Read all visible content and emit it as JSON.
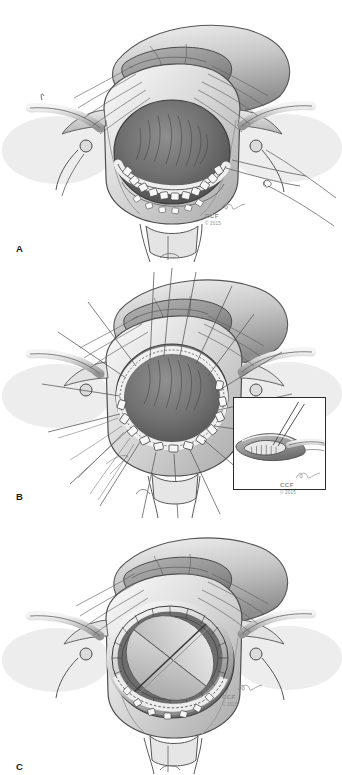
{
  "figure": {
    "background_color": "#ffffff",
    "ink_color": "#3a3a3a",
    "style": "grayscale pen-and-ink and wash surgical illustration",
    "panel_count": 3
  },
  "panels": [
    {
      "label": "A",
      "name": "panel-a",
      "caption": "Aortotomy opened with stay sutures; diseased aortic valve leaflets excised and interrupted pledgeted sutures placed through the aortic annulus",
      "structures": [
        "aortotomy incision",
        "aortic root",
        "right atrial appendage",
        "pulmonary artery",
        "aortic annulus",
        "pledgeted annular sutures",
        "retraction stay sutures",
        "coronary ostium"
      ],
      "signature": {
        "mark": "CCF",
        "year": "© 2015"
      }
    },
    {
      "label": "B",
      "name": "panel-b",
      "caption": "Full circumference of interrupted pledgeted mattress sutures placed around the annulus and splayed radially on the field",
      "structures": [
        "aortic annulus",
        "circumferential pledgeted mattress sutures",
        "radiating suture tails",
        "aortotomy edges",
        "stay sutures"
      ],
      "inset": {
        "name": "suture-technique-inset",
        "caption": "Detail: pledgeted mattress suture passed from ventricular side through the annulus",
        "signature": {
          "mark": "CCF",
          "year": "© 2015"
        }
      },
      "signature": {
        "mark": "CCF",
        "year": "© 2015"
      }
    },
    {
      "label": "C",
      "name": "panel-c",
      "caption": "Bileaflet mechanical prosthesis seated in the supra-annular position with sutures tied around the sewing ring",
      "structures": [
        "bileaflet mechanical valve prosthesis",
        "sewing ring",
        "prosthetic leaflets",
        "tied annular sutures",
        "aortic root",
        "right atrial appendage"
      ],
      "signature": {
        "mark": "CCF",
        "year": "© 2015"
      }
    }
  ]
}
